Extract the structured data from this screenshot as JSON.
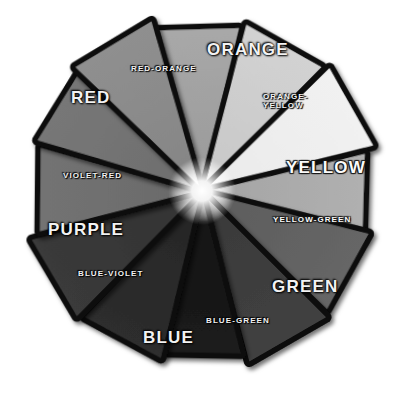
{
  "figure": {
    "type": "color-wheel-diagram",
    "rendering": "grayscale",
    "background_color": "#ffffff",
    "segment_count": 12,
    "center_highlight_color": "#ffffff",
    "border_color": "#0a0a0a"
  },
  "wheel": {
    "center_x": 202,
    "center_y": 191,
    "segments": [
      {
        "id": "orange",
        "label": "ORANGE",
        "label_class": "major",
        "emphasis": "primary",
        "angle_deg": -90,
        "fill": "#9c9c9c",
        "fill_outer": "#a8a8a8",
        "label_x": 207,
        "label_y": 41,
        "rotate_deg": 0
      },
      {
        "id": "orange-yellow",
        "label": "ORANGE-\nYELLOW",
        "label_class": "minor two",
        "emphasis": "tertiary",
        "angle_deg": -60,
        "fill": "#c9c9c9",
        "fill_outer": "#d2d2d2",
        "label_x": 263,
        "label_y": 92,
        "rotate_deg": 0
      },
      {
        "id": "yellow",
        "label": "YELLOW",
        "label_class": "major onlight",
        "emphasis": "primary",
        "angle_deg": -30,
        "fill": "#ebebeb",
        "fill_outer": "#f1f1f1",
        "label_x": 286,
        "label_y": 159,
        "rotate_deg": 0
      },
      {
        "id": "yellow-green",
        "label": "YELLOW-GREEN",
        "label_class": "minor onlight",
        "emphasis": "tertiary",
        "angle_deg": 0,
        "fill": "#a6a6a6",
        "fill_outer": "#b0b0b0",
        "label_x": 273,
        "label_y": 216,
        "rotate_deg": 0
      },
      {
        "id": "green",
        "label": "GREEN",
        "label_class": "major",
        "emphasis": "primary",
        "angle_deg": 30,
        "fill": "#5e5e5e",
        "fill_outer": "#666666",
        "label_x": 272,
        "label_y": 278,
        "rotate_deg": 0
      },
      {
        "id": "blue-green",
        "label": "BLUE-GREEN",
        "label_class": "minor",
        "emphasis": "tertiary",
        "angle_deg": 60,
        "fill": "#3a3a3a",
        "fill_outer": "#414141",
        "label_x": 206,
        "label_y": 317,
        "rotate_deg": 0
      },
      {
        "id": "blue",
        "label": "BLUE",
        "label_class": "major",
        "emphasis": "primary",
        "angle_deg": 90,
        "fill": "#151515",
        "fill_outer": "#1b1b1b",
        "label_x": 143,
        "label_y": 329,
        "rotate_deg": 0
      },
      {
        "id": "blue-violet",
        "label": "BLUE-VIOLET",
        "label_class": "minor",
        "emphasis": "tertiary",
        "angle_deg": 120,
        "fill": "#272727",
        "fill_outer": "#2d2d2d",
        "label_x": 78,
        "label_y": 270,
        "rotate_deg": 0
      },
      {
        "id": "purple",
        "label": "PURPLE",
        "label_class": "major",
        "emphasis": "primary",
        "angle_deg": 150,
        "fill": "#343434",
        "fill_outer": "#3a3a3a",
        "label_x": 48,
        "label_y": 221,
        "rotate_deg": 0
      },
      {
        "id": "violet-red",
        "label": "VIOLET-RED",
        "label_class": "minor",
        "emphasis": "tertiary",
        "angle_deg": 180,
        "fill": "#6b6b6b",
        "fill_outer": "#737373",
        "label_x": 63,
        "label_y": 172,
        "rotate_deg": 0
      },
      {
        "id": "red",
        "label": "RED",
        "label_class": "major",
        "emphasis": "primary",
        "angle_deg": -150,
        "fill": "#6f6f6f",
        "fill_outer": "#777777",
        "label_x": 71,
        "label_y": 89,
        "rotate_deg": 0
      },
      {
        "id": "red-orange",
        "label": "RED-ORANGE",
        "label_class": "minor",
        "emphasis": "tertiary",
        "angle_deg": -120,
        "fill": "#868686",
        "fill_outer": "#8f8f8f",
        "label_x": 131,
        "label_y": 65,
        "rotate_deg": 0
      }
    ]
  }
}
